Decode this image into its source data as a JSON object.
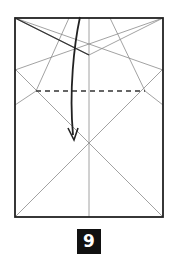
{
  "diagram": {
    "type": "origami-instruction-step",
    "step_number": "9",
    "colors": {
      "outline": "#222222",
      "crease": "#8a8a8a",
      "fold_line": "#333333",
      "arrow": "#222222",
      "badge_bg": "#111111",
      "badge_text": "#ffffff"
    },
    "paper": {
      "x": 15,
      "y": 18,
      "width": 148,
      "height": 199
    },
    "elements": [
      {
        "kind": "valley-fold",
        "style": "dashed",
        "from": [
          36,
          91
        ],
        "to": [
          145,
          91
        ]
      },
      {
        "kind": "fold-arrow",
        "style": "curved",
        "from": [
          80,
          17
        ],
        "to": [
          74,
          139
        ]
      }
    ]
  }
}
